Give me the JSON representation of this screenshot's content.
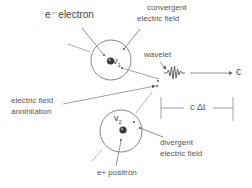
{
  "diagram": {
    "title": "",
    "labels": {
      "electron": "e⁻ electron",
      "convergent_line1": "convergent",
      "convergent_line2": "electric field",
      "wavelet": "wavelet",
      "speed_c": "c",
      "annihilation_line1": "electric field",
      "annihilation_line2": "annihilation",
      "c_delta_t": "c Δt",
      "divergent_line1": "divergent",
      "divergent_line2": "electric field",
      "positron": "e+ positron",
      "v1": "v",
      "v1_sub": "1",
      "v2": "v",
      "v2_sub": "2"
    },
    "nodes": [
      {
        "id": "electron-field",
        "shape": "circle",
        "center": [
          111,
          60
        ],
        "radius": 20,
        "contains": "electron",
        "velocity": "v1"
      },
      {
        "id": "positron-field",
        "shape": "circle",
        "center": [
          121,
          131
        ],
        "radius": 21,
        "contains": "positron",
        "velocity": "v2"
      },
      {
        "id": "wavelet",
        "shape": "squiggle",
        "position": [
          175,
          72
        ]
      }
    ],
    "edges": [
      {
        "from": "wavelet",
        "to": "c",
        "type": "arrow",
        "label": "c"
      },
      {
        "type": "dimension",
        "label": "c Δt",
        "x_range": [
          160,
          234
        ],
        "y": 108
      }
    ],
    "colors": {
      "line": "#777777",
      "text": "#555555",
      "particle": "#333333"
    }
  }
}
